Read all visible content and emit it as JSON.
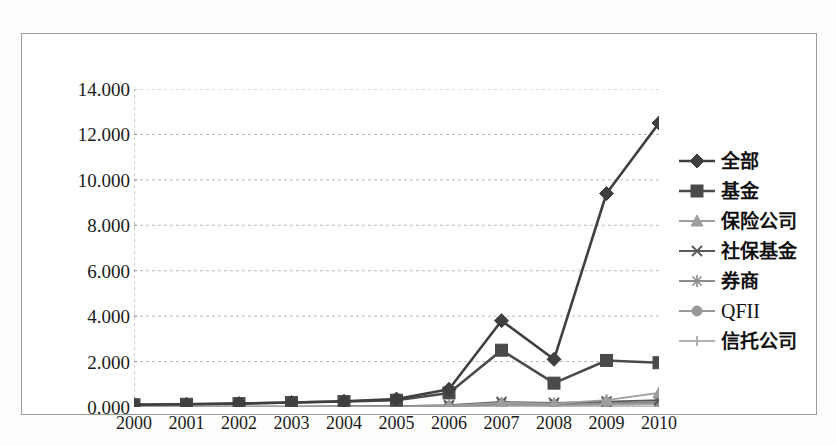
{
  "chart_data": {
    "type": "line",
    "title": "",
    "xlabel": "",
    "ylabel": "",
    "categories": [
      "2000",
      "2001",
      "2002",
      "2003",
      "2004",
      "2005",
      "2006",
      "2007",
      "2008",
      "2009",
      "2010"
    ],
    "ylim": [
      0,
      14
    ],
    "ytick_labels": [
      "0.000",
      "2.000",
      "4.000",
      "6.000",
      "8.000",
      "10.000",
      "12.000",
      "14.000"
    ],
    "ytick_values": [
      0,
      2,
      4,
      6,
      8,
      10,
      12,
      14
    ],
    "grid": true,
    "legend_position": "right",
    "series": [
      {
        "name": "全部",
        "marker": "diamond",
        "color": "#3f3f3f",
        "values": [
          0.1,
          0.12,
          0.15,
          0.2,
          0.25,
          0.35,
          0.78,
          3.8,
          2.1,
          9.4,
          12.5
        ]
      },
      {
        "name": "基金",
        "marker": "square",
        "color": "#4a4a4a",
        "values": [
          0.1,
          0.12,
          0.15,
          0.2,
          0.24,
          0.3,
          0.62,
          2.5,
          1.05,
          2.05,
          1.95
        ]
      },
      {
        "name": "保险公司",
        "marker": "triangle",
        "color": "#9e9e9e",
        "values": [
          0.0,
          0.0,
          0.0,
          0.01,
          0.02,
          0.03,
          0.06,
          0.18,
          0.15,
          0.3,
          0.62
        ]
      },
      {
        "name": "社保基金",
        "marker": "cross",
        "color": "#5a5a5a",
        "values": [
          0.0,
          0.0,
          0.01,
          0.02,
          0.03,
          0.04,
          0.08,
          0.22,
          0.18,
          0.24,
          0.3
        ]
      },
      {
        "name": "券商",
        "marker": "star",
        "color": "#8c8c8c",
        "values": [
          0.0,
          0.0,
          0.01,
          0.01,
          0.02,
          0.03,
          0.05,
          0.14,
          0.12,
          0.18,
          0.22
        ]
      },
      {
        "name": "QFII",
        "marker": "circle",
        "color": "#999999",
        "values": [
          0.0,
          0.0,
          0.0,
          0.0,
          0.01,
          0.02,
          0.04,
          0.1,
          0.09,
          0.13,
          0.17
        ]
      },
      {
        "name": "信托公司",
        "marker": "plus",
        "color": "#b0b0b0",
        "values": [
          0.0,
          0.0,
          0.0,
          0.0,
          0.0,
          0.01,
          0.02,
          0.06,
          0.05,
          0.08,
          0.11
        ]
      }
    ]
  }
}
